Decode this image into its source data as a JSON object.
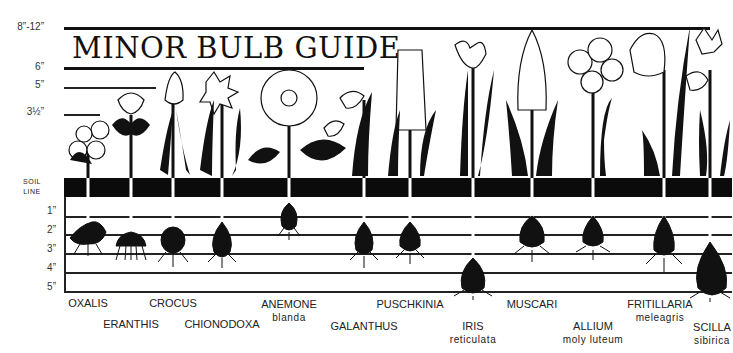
{
  "title": "MINOR BULB GUIDE",
  "height_scale": [
    {
      "label": "8”-12”",
      "y": 28
    },
    {
      "label": "6”",
      "y": 68
    },
    {
      "label": "5”",
      "y": 87
    },
    {
      "label": "3½”",
      "y": 114
    }
  ],
  "soil_line_label": [
    "SOIL",
    "LINE"
  ],
  "depth_scale": [
    {
      "label": "1”",
      "y": 216
    },
    {
      "label": "2”",
      "y": 234
    },
    {
      "label": "3”",
      "y": 253
    },
    {
      "label": "4”",
      "y": 272
    },
    {
      "label": "5”",
      "y": 291
    }
  ],
  "plants": [
    {
      "name": "OXALIS",
      "sub": "",
      "x": 88,
      "label_y": 297,
      "bloom_height": "3½”",
      "planting_depth": "2”"
    },
    {
      "name": "ERANTHIS",
      "sub": "",
      "x": 131,
      "label_y": 318,
      "bloom_height": "5”",
      "planting_depth": "3”"
    },
    {
      "name": "CROCUS",
      "sub": "",
      "x": 173,
      "label_y": 297,
      "bloom_height": "5”",
      "planting_depth": "3”"
    },
    {
      "name": "CHIONODOXA",
      "sub": "",
      "x": 222,
      "label_y": 318,
      "bloom_height": "6”",
      "planting_depth": "3”"
    },
    {
      "name": "ANEMONE",
      "sub": "blanda",
      "x": 289,
      "label_y": 298,
      "bloom_height": "6”",
      "planting_depth": "2”"
    },
    {
      "name": "GALANTHUS",
      "sub": "",
      "x": 364,
      "label_y": 320,
      "bloom_height": "6”",
      "planting_depth": "3”"
    },
    {
      "name": "PUSCHKINIA",
      "sub": "",
      "x": 410,
      "label_y": 298,
      "bloom_height": "8”-12”",
      "planting_depth": "3”"
    },
    {
      "name": "IRIS",
      "sub": "reticulata",
      "x": 473,
      "label_y": 320,
      "bloom_height": "8”-12”",
      "planting_depth": "5”"
    },
    {
      "name": "MUSCARI",
      "sub": "",
      "x": 532,
      "label_y": 298,
      "bloom_height": "8”-12”",
      "planting_depth": "3”"
    },
    {
      "name": "ALLIUM",
      "sub": "moly luteum",
      "x": 593,
      "label_y": 320,
      "bloom_height": "8”-12”",
      "planting_depth": "3”"
    },
    {
      "name": "FRITILLARIA",
      "sub": "meleagris",
      "x": 664,
      "label_y": 298,
      "bloom_height": "8”-12”",
      "planting_depth": "4”"
    },
    {
      "name": "SCILLA",
      "sub": "sibirica",
      "x": 710,
      "label_y": 322,
      "bloom_height": "8”-12”",
      "planting_depth": "5”"
    }
  ],
  "colors": {
    "ink": "#111111",
    "paper": "#ffffff"
  }
}
